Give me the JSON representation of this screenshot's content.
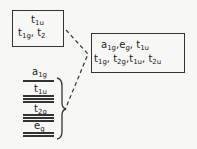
{
  "diagram": {
    "type": "energy-level correlation diagram",
    "left_box": {
      "line1": [
        {
          "base": "t",
          "sub": "1u"
        }
      ],
      "line2": [
        {
          "base": "t",
          "sub": "1g"
        },
        {
          "base": "t",
          "sub": "2"
        }
      ]
    },
    "right_box": {
      "line1": [
        {
          "base": "a",
          "sub": "1g"
        },
        {
          "base": "e",
          "sub": "g"
        },
        {
          "base": "t",
          "sub": "1u"
        }
      ],
      "line2": [
        {
          "base": "t",
          "sub": "1g"
        },
        {
          "base": "t",
          "sub": "2g"
        },
        {
          "base": "t",
          "sub": "1u"
        },
        {
          "base": "t",
          "sub": "2u"
        }
      ]
    },
    "levels": [
      {
        "base": "a",
        "sub": "1g",
        "lines": 1
      },
      {
        "base": "t",
        "sub": "1u",
        "lines": 3
      },
      {
        "base": "t",
        "sub": "2g",
        "lines": 3
      },
      {
        "base": "e",
        "sub": "g",
        "lines": 2
      }
    ],
    "connectors": "dashed",
    "stroke_color": "#333333",
    "background_color": "#f7f7f5"
  }
}
